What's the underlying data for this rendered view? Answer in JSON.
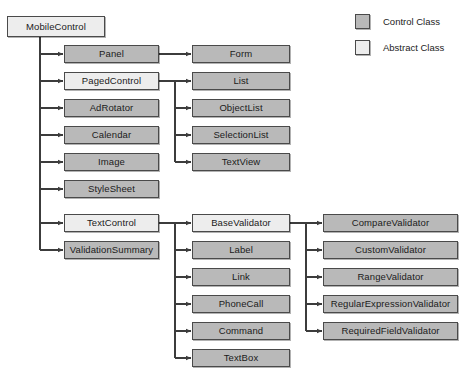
{
  "diagram": {
    "background_color": "#ffffff",
    "edge_color": "#3c3c3c",
    "colors": {
      "control_class_fill": "#b9b9b9",
      "abstract_class_fill": "#ededed",
      "node_border": "#4a4a4a",
      "text": "#1b1b1b"
    }
  },
  "legend": {
    "items": [
      {
        "label": "Control Class",
        "kind": "control",
        "swatch_color": "#b9b9b9"
      },
      {
        "label": "Abstract Class",
        "kind": "abstract",
        "swatch_color": "#ededed"
      }
    ]
  },
  "root": {
    "label": "MobileControl",
    "kind": "abstract",
    "x": 7,
    "y": 16,
    "w": 98,
    "h": 21
  },
  "columns": {
    "level1": [
      {
        "label": "Panel",
        "kind": "control",
        "x": 64,
        "y": 45,
        "w": 95,
        "h": 18
      },
      {
        "label": "PagedControl",
        "kind": "abstract",
        "x": 64,
        "y": 72,
        "w": 95,
        "h": 18
      },
      {
        "label": "AdRotator",
        "kind": "control",
        "x": 64,
        "y": 99,
        "w": 95,
        "h": 18
      },
      {
        "label": "Calendar",
        "kind": "control",
        "x": 64,
        "y": 126,
        "w": 95,
        "h": 18
      },
      {
        "label": "Image",
        "kind": "control",
        "x": 64,
        "y": 153,
        "w": 95,
        "h": 18
      },
      {
        "label": "StyleSheet",
        "kind": "control",
        "x": 64,
        "y": 180,
        "w": 95,
        "h": 18
      },
      {
        "label": "TextControl",
        "kind": "abstract",
        "x": 64,
        "y": 214,
        "w": 95,
        "h": 18
      },
      {
        "label": "ValidationSummary",
        "kind": "control",
        "x": 64,
        "y": 241,
        "w": 95,
        "h": 18
      }
    ],
    "level2_top": [
      {
        "label": "Form",
        "kind": "control",
        "x": 192,
        "y": 45,
        "w": 98,
        "h": 18
      },
      {
        "label": "List",
        "kind": "control",
        "x": 192,
        "y": 72,
        "w": 98,
        "h": 18
      },
      {
        "label": "ObjectList",
        "kind": "control",
        "x": 192,
        "y": 99,
        "w": 98,
        "h": 18
      },
      {
        "label": "SelectionList",
        "kind": "control",
        "x": 192,
        "y": 126,
        "w": 98,
        "h": 18
      },
      {
        "label": "TextView",
        "kind": "control",
        "x": 192,
        "y": 153,
        "w": 98,
        "h": 18
      }
    ],
    "level2_bottom": [
      {
        "label": "BaseValidator",
        "kind": "abstract",
        "x": 192,
        "y": 214,
        "w": 98,
        "h": 18
      },
      {
        "label": "Label",
        "kind": "control",
        "x": 192,
        "y": 241,
        "w": 98,
        "h": 18
      },
      {
        "label": "Link",
        "kind": "control",
        "x": 192,
        "y": 268,
        "w": 98,
        "h": 18
      },
      {
        "label": "PhoneCall",
        "kind": "control",
        "x": 192,
        "y": 295,
        "w": 98,
        "h": 18
      },
      {
        "label": "Command",
        "kind": "control",
        "x": 192,
        "y": 322,
        "w": 98,
        "h": 18
      },
      {
        "label": "TextBox",
        "kind": "control",
        "x": 192,
        "y": 349,
        "w": 98,
        "h": 18
      }
    ],
    "level3": [
      {
        "label": "CompareValidator",
        "kind": "control",
        "x": 323,
        "y": 214,
        "w": 135,
        "h": 18
      },
      {
        "label": "CustomValidator",
        "kind": "control",
        "x": 323,
        "y": 241,
        "w": 135,
        "h": 18
      },
      {
        "label": "RangeValidator",
        "kind": "control",
        "x": 323,
        "y": 268,
        "w": 135,
        "h": 18
      },
      {
        "label": "RegularExpressionValidator",
        "kind": "control",
        "x": 323,
        "y": 295,
        "w": 135,
        "h": 18
      },
      {
        "label": "RequiredFieldValidator",
        "kind": "control",
        "x": 323,
        "y": 322,
        "w": 135,
        "h": 18
      }
    ]
  },
  "legend_layout": {
    "rows": [
      {
        "x": 355,
        "y": 14
      },
      {
        "x": 355,
        "y": 40
      }
    ]
  },
  "edges": {
    "root_trunk": {
      "from": "MobileControl",
      "x": 40,
      "y_start": 37,
      "y_end": 250
    },
    "paged_trunk": {
      "from": "PagedControl",
      "x": 175,
      "y_start": 81,
      "y_end": 162
    },
    "textcontrol_trunk": {
      "from": "TextControl",
      "x": 175,
      "y_start": 223,
      "y_end": 358
    },
    "basevalidator_trunk": {
      "from": "BaseValidator",
      "x": 306,
      "y_start": 223,
      "y_end": 331
    },
    "panel_to_form": {
      "from": "Panel",
      "to": "Form",
      "y": 54
    }
  }
}
